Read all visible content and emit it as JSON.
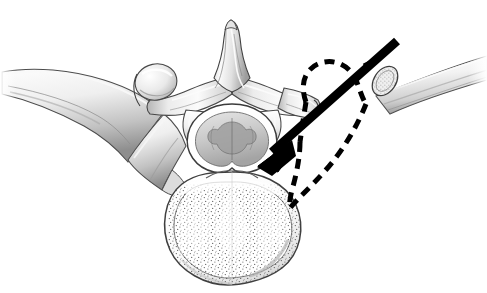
{
  "figure": {
    "title": "Axial view of thoracic vertebra with costotransversectomy approach",
    "type": "medical-anatomical-illustration",
    "view": "axial (superior) cross-section",
    "style": "grayscale pen-and-ink / airbrush medical illustration on white background",
    "canvas": {
      "width": 487,
      "height": 293,
      "background": "#ffffff"
    }
  },
  "colors": {
    "background": "#ffffff",
    "outline": "#2b2b2b",
    "bone_light": "#f4f4f4",
    "bone_mid": "#d8d8d8",
    "bone_shadow": "#9a9a9a",
    "bone_deep_shadow": "#6e6e6e",
    "cortical_edge": "#555555",
    "trabecular_dot": "#4a4a4a",
    "arrow": "#000000",
    "dashed_outline": "#000000",
    "cord_gray": "#b9b9b9",
    "cord_dark": "#8c8c8c"
  },
  "structures": [
    {
      "id": "spinous-process",
      "label": "Spinous process",
      "description": "Midline posterior bony projection pointing superiorly in the image",
      "position": {
        "x": 232,
        "y": 55
      }
    },
    {
      "id": "lamina-left",
      "label": "Left lamina",
      "description": "Flat bony plate sweeping laterally from spinous process to the left",
      "position": {
        "x": 185,
        "y": 95
      }
    },
    {
      "id": "lamina-right",
      "label": "Right lamina",
      "description": "Flat bony plate sweeping laterally from spinous process to the right",
      "position": {
        "x": 278,
        "y": 95
      }
    },
    {
      "id": "transverse-process-left",
      "label": "Left transverse process",
      "description": "Lateral bony process articulating with the left rib",
      "position": {
        "x": 155,
        "y": 88
      }
    },
    {
      "id": "transverse-process-right",
      "label": "Right transverse process",
      "description": "Lateral bony process; partially resected, remnant shown with dashed outline",
      "position": {
        "x": 297,
        "y": 96
      }
    },
    {
      "id": "superior-articular-process-left",
      "label": "Left superior articular process",
      "description": "Rounded facet process superior-lateral to the lamina",
      "position": {
        "x": 152,
        "y": 80
      }
    },
    {
      "id": "pedicle-left",
      "label": "Left pedicle",
      "description": "Short bony bridge connecting the posterior arch to the vertebral body",
      "position": {
        "x": 191,
        "y": 128
      }
    },
    {
      "id": "pedicle-right",
      "label": "Right pedicle",
      "description": "Short bony bridge connecting the posterior arch to the vertebral body",
      "position": {
        "x": 272,
        "y": 128
      }
    },
    {
      "id": "spinal-canal",
      "label": "Spinal canal",
      "description": "Central vertebral foramen containing the spinal cord",
      "position": {
        "x": 232,
        "y": 142
      }
    },
    {
      "id": "spinal-cord",
      "label": "Spinal cord",
      "description": "Butterfly-shaped gray matter within the spinal canal",
      "position": {
        "x": 232,
        "y": 142
      }
    },
    {
      "id": "vertebral-body",
      "label": "Vertebral body",
      "description": "Large anterior body with cortical rim and stippled cancellous (trabecular) bone",
      "position": {
        "x": 232,
        "y": 220
      }
    },
    {
      "id": "cancellous-bone",
      "label": "Cancellous (trabecular) bone",
      "description": "Stippled dot texture filling the vertebral body interior",
      "position": {
        "x": 232,
        "y": 222
      }
    },
    {
      "id": "rib-left",
      "label": "Left rib",
      "description": "Intact rib curving away to the left, articulating at the costotransverse and costovertebral joints",
      "position": {
        "x": 85,
        "y": 110
      }
    },
    {
      "id": "rib-right-cut",
      "label": "Right rib (cut / resected proximal segment)",
      "description": "Right rib transected; cut end shows cancellous cross-section",
      "position": {
        "x": 400,
        "y": 75
      }
    },
    {
      "id": "rib-cut-surface",
      "label": "Cut rib cross-section",
      "description": "Oval cut face of the rib with stippled cancellous bone and cortical rim",
      "position": {
        "x": 385,
        "y": 80
      }
    }
  ],
  "annotations": {
    "arrow": {
      "id": "approach-arrow",
      "label": "Surgical approach trajectory arrow",
      "description": "Thick solid black arrow entering from upper right, directed infero-medially toward the pedicle / vertebral body junction",
      "style": "solid",
      "color": "#000000",
      "thickness_px": 9,
      "tail": {
        "x": 397,
        "y": 41
      },
      "head": {
        "x": 258,
        "y": 165
      },
      "direction": "upper-right to lower-left"
    },
    "dashed_outline": {
      "id": "resection-outline",
      "label": "Dashed resection outline",
      "description": "Dashed black line marking the outline of the resected rib head, neck and transverse process (costotransversectomy)",
      "style": "dashed",
      "color": "#000000",
      "thickness_px": 5,
      "dash_pattern": "10 7"
    }
  },
  "legend": {
    "visible": false,
    "items": []
  },
  "text_labels": []
}
